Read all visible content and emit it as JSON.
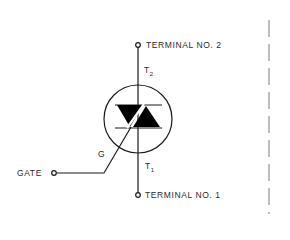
{
  "diagram": {
    "type": "triac-symbol",
    "labels": {
      "terminal_2": "TERMINAL NO. 2",
      "terminal_1": "TERMINAL NO. 1",
      "gate": "GATE",
      "gate_lead": "G",
      "t2_letter": "T",
      "t2_sub": "2",
      "t1_letter": "T",
      "t1_sub": "1"
    },
    "colors": {
      "line": "#1a1a1a",
      "fill": "#000000",
      "dashed_border": "#9a9a9a",
      "text": "#2a2a2a"
    }
  }
}
